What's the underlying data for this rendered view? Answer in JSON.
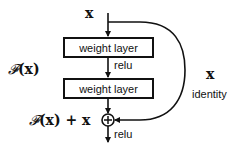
{
  "diagram": {
    "input_label": "x",
    "layers": [
      {
        "label": "weight layer"
      },
      {
        "label": "weight layer"
      }
    ],
    "activation_between": "relu",
    "activation_after": "relu",
    "residual_function_label": {
      "F": "𝓕",
      "arg": "(x)"
    },
    "sum_label": {
      "F": "𝓕",
      "rest": "(x) + x"
    },
    "shortcut": {
      "var": "x",
      "label": "identity"
    },
    "add_operator": "⊕",
    "colors": {
      "stroke": "#111111",
      "background": "#ffffff"
    }
  }
}
